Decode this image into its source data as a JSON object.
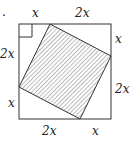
{
  "diagram": {
    "type": "geometry",
    "colors": {
      "stroke": "#333333",
      "hatch": "#555555",
      "background": "#ffffff"
    },
    "outer_square": {
      "x1": 19,
      "y1": 24,
      "x2": 111,
      "y2": 119
    },
    "inner_square": {
      "points": "50,24 111,56 80,119 19,87",
      "fill": "hatched"
    },
    "right_angle_marker": {
      "x": 19,
      "y": 24,
      "size": 13
    },
    "labels": {
      "top_left": "x",
      "top_right": "2x",
      "right_top": "x",
      "right_bottom": "2x",
      "bottom_left": "2x",
      "bottom_right": "x",
      "left_top": "2x",
      "left_bottom": "x"
    },
    "stray_mark": "."
  }
}
